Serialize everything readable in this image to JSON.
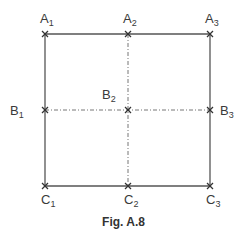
{
  "figure": {
    "caption": "Fig. A.8",
    "points": {
      "A1": {
        "letter": "A",
        "sub": "1"
      },
      "A2": {
        "letter": "A",
        "sub": "2"
      },
      "A3": {
        "letter": "A",
        "sub": "3"
      },
      "B1": {
        "letter": "B",
        "sub": "1"
      },
      "B2": {
        "letter": "B",
        "sub": "2"
      },
      "B3": {
        "letter": "B",
        "sub": "3"
      },
      "C1": {
        "letter": "C",
        "sub": "1"
      },
      "C2": {
        "letter": "C",
        "sub": "2"
      },
      "C3": {
        "letter": "C",
        "sub": "3"
      }
    },
    "marker": "x",
    "colors": {
      "line": "#555555",
      "text": "#3a3a3a"
    }
  }
}
